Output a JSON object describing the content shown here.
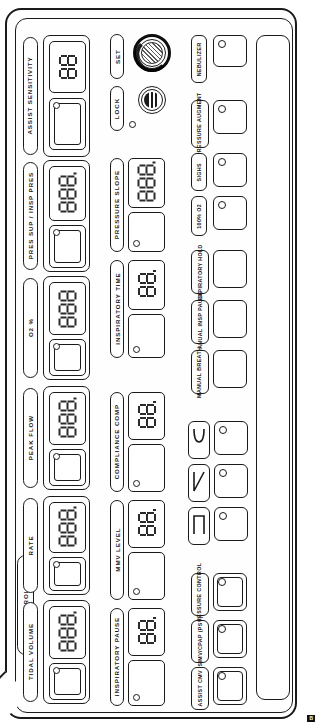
{
  "panel": {
    "section_label": "CONTROLS",
    "page_mark": "B"
  },
  "set_knob": {
    "label": "SET",
    "icon": "rotary-knob-icon"
  },
  "lock": {
    "label": "LOCK",
    "icon": "lock-indicator-icon"
  },
  "left_column": [
    {
      "label": "ASSIST SENSITIVITY",
      "digits": 2,
      "value": "88"
    },
    {
      "label": "PRES SUP / INSP PRES",
      "digits": 3,
      "value": "888"
    },
    {
      "label": "O2 %",
      "digits": 3,
      "value": "888"
    },
    {
      "label": "PEAK FLOW",
      "digits": 3,
      "value": "888"
    },
    {
      "label": "RATE",
      "digits": 3,
      "value": "888"
    },
    {
      "label": "TIDAL VOLUME",
      "digits": 3,
      "value": "888"
    }
  ],
  "middle_column": [
    {
      "label": "PRESSURE SLOPE",
      "digits": 3,
      "value": "888"
    },
    {
      "label": "INSPIRATORY TIME",
      "digits": 2,
      "value": "88"
    },
    {
      "label": "COMPLIANCE COMP",
      "digits": 2,
      "value": "88"
    },
    {
      "label": "MMV LEVEL",
      "digits": 2,
      "value": "88"
    },
    {
      "label": "INSPIRATORY PAUSE",
      "digits": 2,
      "value": "88"
    }
  ],
  "right_column": {
    "buttons": [
      {
        "label": "NEBULIZER",
        "has_led": true
      },
      {
        "label": "PRESSURE AUGMENT",
        "has_led": true
      },
      {
        "label": "SIGHS",
        "has_led": true
      },
      {
        "label": "100% O2",
        "has_led": true
      },
      {
        "label": "EXPIRATORY HOLD",
        "has_led": false
      },
      {
        "label": "MANUAL INSP PAUSE",
        "has_led": false
      },
      {
        "label": "MANUAL BREATH",
        "has_led": false
      }
    ],
    "waveforms": [
      {
        "name": "sine-waveform-icon",
        "has_led": true
      },
      {
        "name": "descending-ramp-waveform-icon",
        "has_led": true
      },
      {
        "name": "square-waveform-icon",
        "has_led": true
      }
    ],
    "modes": [
      {
        "label": "PRESSURE CONTROL",
        "has_led": true
      },
      {
        "label": "SIMV/CPAP (PSV)",
        "has_led": true
      },
      {
        "label": "ASSIST CMV",
        "has_led": true
      }
    ]
  }
}
